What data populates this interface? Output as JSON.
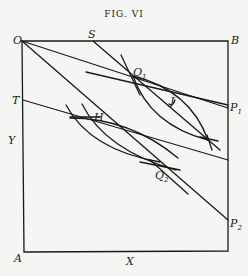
{
  "figure": {
    "title": "FIG. VI",
    "labels": {
      "O": "O",
      "S": "S",
      "B": "B",
      "T": "T",
      "Y": "Y",
      "A": "A",
      "X": "X",
      "H": "H",
      "J": "J",
      "Q1": {
        "base": "Q",
        "sub": "1"
      },
      "Q2": {
        "base": "Q",
        "sub": "2"
      },
      "P1": {
        "base": "P",
        "sub": "1"
      },
      "P2": {
        "base": "P",
        "sub": "2"
      }
    },
    "stroke_color": "#1a1a1a",
    "background": "#f5f5f3"
  }
}
